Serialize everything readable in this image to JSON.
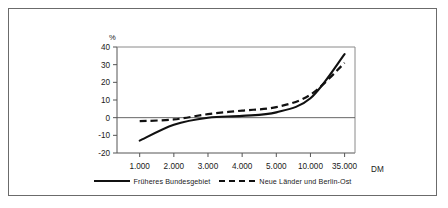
{
  "figure": {
    "unit_label": "%",
    "x_axis_title": "DM"
  },
  "legend": {
    "position": "bottom",
    "items": [
      {
        "label": "Früheres Bundesgebiet",
        "style": "solid",
        "color": "#111111"
      },
      {
        "label": "Neue Länder und Berlin-Ost",
        "style": "dashed",
        "color": "#111111"
      }
    ]
  },
  "chart_data": {
    "type": "line",
    "title": "",
    "subtitle": "",
    "xlabel": "DM",
    "ylabel": "%",
    "categories": [
      "1.000",
      "2.000",
      "3.000",
      "4.000",
      "5.000",
      "10.000",
      "35.000"
    ],
    "ytick_labels": [
      "40",
      "30",
      "20",
      "10",
      "0",
      "-10",
      "-20"
    ],
    "ytick_values": [
      40,
      30,
      20,
      10,
      0,
      -10,
      -20
    ],
    "ylim": [
      -20,
      40
    ],
    "grid": false,
    "zero_line": 0,
    "legend_position": "bottom",
    "series": [
      {
        "name": "Früheres Bundesgebiet",
        "style": "solid",
        "color": "#111111",
        "values": [
          -13,
          -4,
          0,
          1,
          3,
          11,
          36
        ]
      },
      {
        "name": "Neue Länder und Berlin-Ost",
        "style": "dashed",
        "color": "#111111",
        "values": [
          -2,
          -1,
          2,
          4,
          6,
          13,
          31
        ]
      }
    ]
  }
}
